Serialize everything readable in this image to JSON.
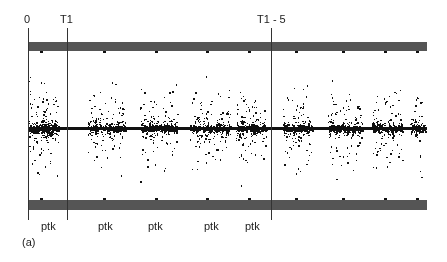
{
  "figure": {
    "panel_label": "(a)",
    "markers": [
      {
        "label": "0",
        "x": 28,
        "label_x": 24
      },
      {
        "label": "T1",
        "x": 67,
        "label_x": 60
      },
      {
        "label": "T1 - 5",
        "x": 271,
        "label_x": 257
      }
    ],
    "segment_labels": [
      {
        "label": "ptk",
        "x": 41
      },
      {
        "label": "ptk",
        "x": 98
      },
      {
        "label": "ptk",
        "x": 148
      },
      {
        "label": "ptk",
        "x": 204
      },
      {
        "label": "ptk",
        "x": 245
      }
    ],
    "bars": {
      "color": "#555555",
      "x_start": 28,
      "x_end": 427,
      "top": {
        "y": 42,
        "height": 9
      },
      "bottom": {
        "y": 200,
        "height": 10
      }
    },
    "baseline_y": 128,
    "dot_color": "#111111",
    "clusters": [
      {
        "x0": 28,
        "x1": 58,
        "n": 260,
        "spread": 80
      },
      {
        "x0": 88,
        "x1": 125,
        "n": 190,
        "spread": 62
      },
      {
        "x0": 140,
        "x1": 177,
        "n": 200,
        "spread": 70
      },
      {
        "x0": 190,
        "x1": 230,
        "n": 210,
        "spread": 72
      },
      {
        "x0": 236,
        "x1": 266,
        "n": 180,
        "spread": 72
      },
      {
        "x0": 283,
        "x1": 312,
        "n": 160,
        "spread": 70
      },
      {
        "x0": 328,
        "x1": 362,
        "n": 170,
        "spread": 70
      },
      {
        "x0": 372,
        "x1": 402,
        "n": 160,
        "spread": 72
      },
      {
        "x0": 410,
        "x1": 425,
        "n": 70,
        "spread": 70
      }
    ]
  }
}
